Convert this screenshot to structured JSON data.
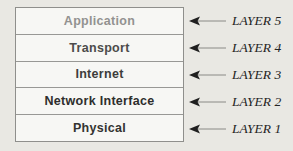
{
  "diagram": {
    "background_color": "#e9e8e3",
    "box_fill_color": "#f7f7f4",
    "box_border_color": "#8f8f8c",
    "arrow_head_color": "#1f1f1f",
    "arrow_tail_color": "#8a8a86",
    "layers": [
      {
        "name": "Application",
        "tag": "LAYER 5",
        "text_color": "#929290"
      },
      {
        "name": "Transport",
        "tag": "LAYER 4",
        "text_color": "#4c4c4a"
      },
      {
        "name": "Internet",
        "tag": "LAYER 3",
        "text_color": "#3d3d3b"
      },
      {
        "name": "Network Interface",
        "tag": "LAYER 2",
        "text_color": "#2e2e2c"
      },
      {
        "name": "Physical",
        "tag": "LAYER 1",
        "text_color": "#333331"
      }
    ]
  }
}
